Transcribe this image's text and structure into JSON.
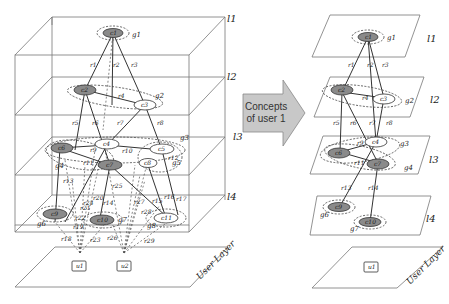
{
  "arrow": {
    "line1": "Concepts",
    "line2": "of user 1"
  },
  "left_cube": {
    "layer_labels": [
      "l1",
      "l2",
      "l3",
      "l4"
    ],
    "user_layer_label": "User Layer",
    "users": [
      "u1",
      "u2"
    ],
    "concepts": [
      "c1",
      "c2",
      "c3",
      "c4",
      "c5",
      "c6",
      "c7",
      "c8",
      "c9",
      "c10",
      "c11"
    ],
    "groups": [
      "g1",
      "g2",
      "g3",
      "g4",
      "g5",
      "g6",
      "g7",
      "g8"
    ],
    "relations": [
      "r1",
      "r2",
      "r3",
      "r4",
      "r5",
      "r6",
      "r7",
      "r8",
      "r9",
      "r10",
      "r11",
      "r12",
      "r13",
      "r14",
      "r15",
      "r16",
      "r17",
      "r18",
      "r19",
      "r20",
      "r21",
      "r22",
      "r23",
      "r24",
      "r25",
      "r26",
      "r27",
      "r28",
      "r29"
    ]
  },
  "right_stack": {
    "layer_labels": [
      "l1",
      "l2",
      "l3",
      "l4"
    ],
    "user_layer_label": "User Layer",
    "user": "u1",
    "concepts": [
      "c1",
      "c2",
      "c3",
      "c4",
      "c5",
      "c6",
      "c7",
      "c9",
      "c10"
    ],
    "groups": [
      "g1",
      "g2",
      "g3",
      "g4",
      "g6",
      "g7"
    ],
    "relations": [
      "r1",
      "r2",
      "r3",
      "r4",
      "r5",
      "r6",
      "r7",
      "r8",
      "r9",
      "r11",
      "r13",
      "r14"
    ]
  }
}
